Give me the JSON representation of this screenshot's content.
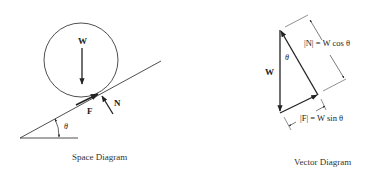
{
  "space_diagram": {
    "caption": "Space Diagram",
    "labels": {
      "weight": "W",
      "friction": "F",
      "normal": "N",
      "angle": "θ"
    }
  },
  "vector_diagram": {
    "caption": "Vector Diagram",
    "labels": {
      "weight": "W",
      "angle": "θ",
      "normal_magnitude": "|N| = W cos θ",
      "friction_magnitude": "|F| = W sin θ"
    }
  },
  "colors": {
    "ink": "#222222",
    "background": "#ffffff"
  }
}
